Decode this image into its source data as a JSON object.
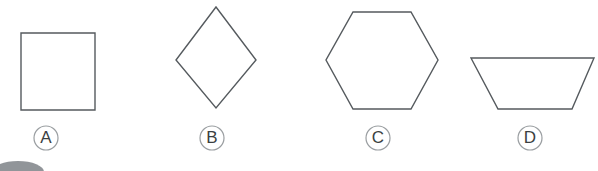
{
  "figure": {
    "background_color": "#ffffff",
    "stroke_color": "#555a5e",
    "label_circle_stroke": "#9a9ea1",
    "label_text_color": "#3b3f42",
    "blob_color": "#7e8387"
  },
  "options": [
    {
      "id": "option-a",
      "label": "A",
      "shape_name": "square",
      "label_center": {
        "x": 46,
        "y": 138
      },
      "label_radius": 12,
      "points": "21,33 95,33 95,110 21,110"
    },
    {
      "id": "option-b",
      "label": "B",
      "shape_name": "rhombus",
      "label_center": {
        "x": 212,
        "y": 138
      },
      "label_radius": 12,
      "points": "216,7 256,60 216,108 176,60"
    },
    {
      "id": "option-c",
      "label": "C",
      "shape_name": "hexagon",
      "label_center": {
        "x": 378,
        "y": 138
      },
      "label_radius": 12,
      "points": "353,12 411,12 438,60 411,109 353,109 326,60"
    },
    {
      "id": "option-d",
      "label": "D",
      "shape_name": "trapezoid",
      "label_center": {
        "x": 530,
        "y": 138
      },
      "label_radius": 12,
      "points": "471,58 594,58 572,109 498,109"
    }
  ],
  "decor": {
    "corner_blob": {
      "name": "corner-blob",
      "cx": 18,
      "cy": 172,
      "rx": 26,
      "ry": 11
    }
  }
}
